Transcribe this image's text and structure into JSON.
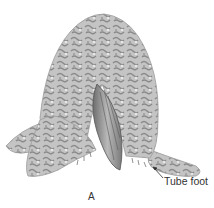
{
  "figure": {
    "colors": {
      "body": "#bdbdbd",
      "mottle": "#8f8f8f",
      "light": "#e2e2e2",
      "shell": "#9a9a9a",
      "text": "#333333"
    }
  },
  "labels": {
    "tube_foot": "Tube foot",
    "panel": "A"
  }
}
